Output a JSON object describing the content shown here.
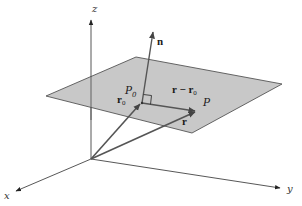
{
  "figure": {
    "colors": {
      "plane_fill": "#c8c8c8",
      "plane_edge": "#555555",
      "axis": "#444444",
      "vector": "#555555",
      "text": "#1a1a1a"
    },
    "axes": {
      "x_label": "x",
      "y_label": "y",
      "z_label": "z"
    },
    "points": {
      "P0_label": "P",
      "P0_subscript": "0",
      "P_label": "P"
    },
    "vectors": {
      "normal_label": "n",
      "r0_label": "r",
      "r0_subscript": "0",
      "r_label": "r",
      "diff_label": "r − r",
      "diff_subscript": "0"
    },
    "annotations": {
      "right_angle": "right-angle marker between n and r − r0"
    }
  }
}
